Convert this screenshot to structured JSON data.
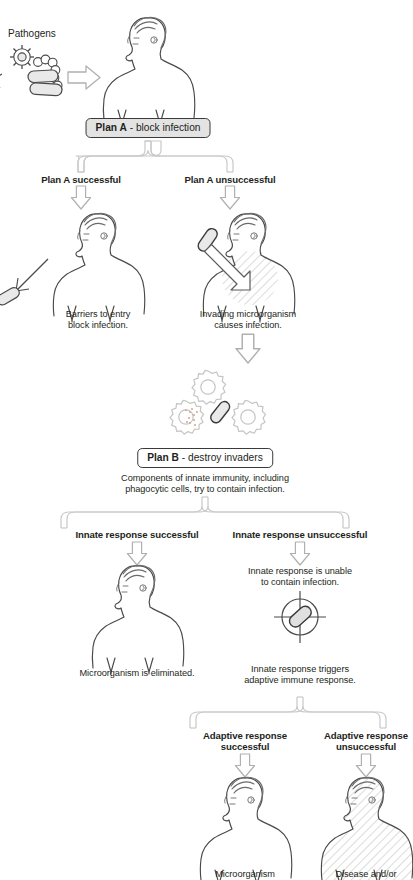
{
  "diagram": {
    "colors": {
      "ink": "#231f20",
      "outline_gray": "#9b9b9b",
      "figure_line": "#4a4a4a",
      "box_fill": "#e3e3e3",
      "box_border": "#3a3a3a",
      "hatch": "#b5b5b5"
    }
  },
  "labels": {
    "pathogens": "Pathogens"
  },
  "plan_a": {
    "box_name": "Plan A",
    "box_rest": " - block infection",
    "branch_success": "Plan A successful",
    "branch_fail": "Plan A unsuccessful",
    "caption_success_line1": "Barriers to entry",
    "caption_success_line2": "block infection.",
    "caption_fail_line1": "Invading microorganism",
    "caption_fail_line2": "causes infection."
  },
  "plan_b": {
    "box_name": "Plan B",
    "box_rest": " - destroy invaders",
    "caption_line1": "Components of innate immunity, including",
    "caption_line2": "phagocytic cells, try to contain infection.",
    "branch_success": "Innate response successful",
    "branch_fail": "Innate response unsuccessful",
    "caption_success": "Microorganism is eliminated.",
    "caption_fail_top_line1": "Innate response is unable",
    "caption_fail_top_line2": "to contain infection.",
    "caption_fail_bottom_line1": "Innate response triggers",
    "caption_fail_bottom_line2": "adaptive immune response."
  },
  "adaptive": {
    "branch_success_line1": "Adaptive response",
    "branch_success_line2": "successful",
    "branch_fail_line1": "Adaptive response",
    "branch_fail_line2": "unsuccessful",
    "caption_success": "Microorganism",
    "caption_fail": "Disease and/or"
  },
  "icons": {
    "virus": "virus-icon",
    "coccus_chain": "bacteria-chain-icon",
    "bacillus": "rod-bacterium-icon",
    "phagocyte": "phagocyte-cell-icon",
    "crosshair": "crosshair-target-icon",
    "block_arrow": "block-arrow-down-icon",
    "brace": "branch-brace-icon",
    "human": "human-figure-icon",
    "human_infected": "infected-human-figure-icon"
  }
}
